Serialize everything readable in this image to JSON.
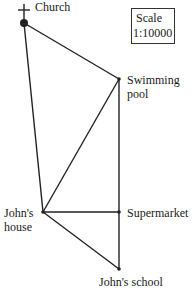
{
  "diagram": {
    "type": "scale map",
    "scale": {
      "title": "Scale",
      "ratio": "1:10000"
    },
    "locations": [
      {
        "id": "church",
        "label": "Church",
        "x": 24,
        "y": 23
      },
      {
        "id": "swimming_pool",
        "label_line1": "Swimming",
        "label_line2": "pool",
        "x": 119,
        "y": 79
      },
      {
        "id": "johns_house",
        "label_line1": "John's",
        "label_line2": "house",
        "x": 43,
        "y": 212
      },
      {
        "id": "supermarket",
        "label": "Supermarket",
        "x": 119,
        "y": 212
      },
      {
        "id": "johns_school",
        "label": "John's school",
        "x": 119,
        "y": 269
      }
    ],
    "edges": [
      [
        "church",
        "swimming_pool"
      ],
      [
        "church",
        "johns_house"
      ],
      [
        "swimming_pool",
        "johns_house"
      ],
      [
        "swimming_pool",
        "supermarket"
      ],
      [
        "johns_house",
        "supermarket"
      ],
      [
        "johns_house",
        "johns_school"
      ],
      [
        "supermarket",
        "johns_school"
      ]
    ],
    "line_color": "#222222"
  }
}
